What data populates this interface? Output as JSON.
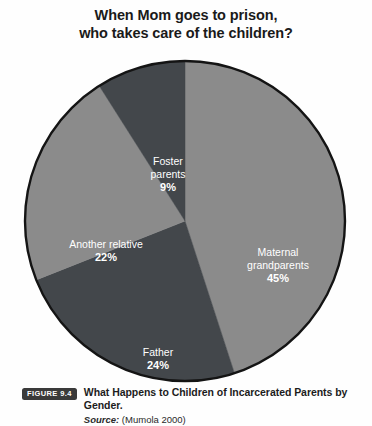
{
  "chart_data": {
    "type": "pie",
    "title": "When Mom goes to prison, who takes care of the children?",
    "title_lines": [
      "When Mom goes to prison,",
      "who takes care of the children?"
    ],
    "categories": [
      "Maternal grandparents",
      "Father",
      "Another relative",
      "Foster parents"
    ],
    "values": [
      45,
      24,
      22,
      9
    ],
    "value_unit": "%",
    "slices": [
      {
        "label": "Maternal grandparents",
        "label_lines": [
          "Maternal",
          "grandparents"
        ],
        "value": 45,
        "value_text": "45%",
        "color": "#8b8b8b",
        "label_x": 258,
        "label_y": 198
      },
      {
        "label": "Father",
        "label_lines": [
          "Father"
        ],
        "value": 24,
        "value_text": "24%",
        "color": "#43474b",
        "label_x": 138,
        "label_y": 298
      },
      {
        "label": "Another relative",
        "label_lines": [
          "Another relative"
        ],
        "value": 22,
        "value_text": "22%",
        "color": "#8b8b8b",
        "label_x": 86,
        "label_y": 190
      },
      {
        "label": "Foster parents",
        "label_lines": [
          "Foster",
          "parents"
        ],
        "value": 9,
        "value_text": "9%",
        "color": "#43474b",
        "label_x": 148,
        "label_y": 107
      }
    ],
    "start_angle_deg": 0,
    "direction": "clockwise",
    "legend": "none",
    "grid": false,
    "outline_color": "#141414",
    "background": "#fefefe"
  },
  "caption": {
    "badge": "FIGURE 9.4",
    "title": "What Happens to Children of Incarcerated Parents by Gender.",
    "source_label": "Source:",
    "source_value": "(Mumola 2000)"
  }
}
